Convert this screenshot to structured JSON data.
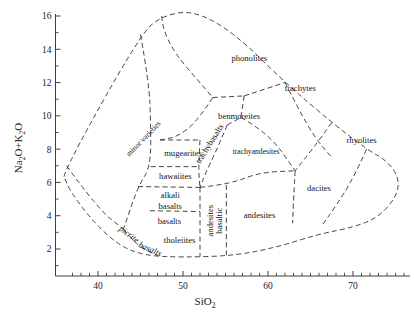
{
  "chart_data": {
    "type": "diagram",
    "title": "",
    "xlabel": "SiO",
    "xlabel_sub": "2",
    "ylabel_parts": [
      "Na",
      "2",
      "O+K",
      "2",
      "O"
    ],
    "ylabel": "Na2O+K2O",
    "xlim": [
      35,
      77
    ],
    "ylim": [
      0,
      16.8
    ],
    "xticks_major": [
      40,
      50,
      60,
      70
    ],
    "xticks_minor": [
      37,
      38,
      39,
      41,
      42,
      43,
      44,
      45,
      46,
      47,
      48,
      49,
      51,
      52,
      53,
      54,
      55,
      56,
      57,
      58,
      59,
      61,
      62,
      63,
      64,
      65,
      66,
      67,
      68,
      69,
      71,
      72,
      73,
      74,
      75,
      76
    ],
    "yticks_major": [
      2,
      4,
      6,
      8,
      10,
      12,
      14,
      16
    ],
    "yticks_minor": [
      1,
      3,
      5,
      7,
      9,
      11,
      13,
      15
    ],
    "grid": false,
    "legend": "none",
    "fields": [
      {
        "name": "phonolites",
        "label": "phonolites",
        "rotation": 0,
        "x": 57.8,
        "y": 13.4
      },
      {
        "name": "trachytes",
        "label": "trachytes",
        "rotation": 0,
        "x": 63.8,
        "y": 11.6
      },
      {
        "name": "rhyolites",
        "label": "rhyolites",
        "rotation": 0,
        "x": 71.0,
        "y": 8.5
      },
      {
        "name": "benmoreites",
        "label": "benmoreites",
        "rotation": 0,
        "x": 56.6,
        "y": 9.9
      },
      {
        "name": "trachyandesites",
        "label": "trachyandesites",
        "rotation": 0,
        "x": 58.6,
        "y": 7.8
      },
      {
        "name": "trachybasalts",
        "label": "trachybasalts",
        "rotation": -58,
        "x": 53.2,
        "y": 8.3
      },
      {
        "name": "mugearites",
        "label": "mugearites",
        "rotation": 0,
        "x": 50.0,
        "y": 7.7
      },
      {
        "name": "hawaiites",
        "label": "hawaiites",
        "rotation": 0,
        "x": 49.1,
        "y": 6.3
      },
      {
        "name": "minor-varieties",
        "label": "minor varieties",
        "rotation": -46,
        "x": 45.4,
        "y": 8.6
      },
      {
        "name": "alkali-basalts-line1",
        "label": "alkali",
        "rotation": 0,
        "x": 48.5,
        "y": 5.2
      },
      {
        "name": "alkali-basalts-line2",
        "label": "basalts",
        "rotation": 0,
        "x": 48.5,
        "y": 4.55
      },
      {
        "name": "basalts",
        "label": "basalts",
        "rotation": 0,
        "x": 48.4,
        "y": 3.6
      },
      {
        "name": "tholeiites",
        "label": "tholeiites",
        "rotation": 0,
        "x": 49.6,
        "y": 2.5
      },
      {
        "name": "picrite-basalts-line1",
        "label": "picrite",
        "rotation": 37,
        "x": 43.6,
        "y": 2.85
      },
      {
        "name": "picrite-basalts-line2",
        "label": "basalts",
        "rotation": 24,
        "x": 46.1,
        "y": 1.95
      },
      {
        "name": "basaltic-andesites-line1",
        "label": "basaltic",
        "rotation": -90,
        "x": 54.3,
        "y": 3.7
      },
      {
        "name": "basaltic-andesites-line2",
        "label": "andesites",
        "rotation": -90,
        "x": 53.3,
        "y": 3.7
      },
      {
        "name": "andesites",
        "label": "andesites",
        "rotation": 0,
        "x": 59.0,
        "y": 4.0
      },
      {
        "name": "dacites",
        "label": "dacites",
        "rotation": 0,
        "x": 66.0,
        "y": 5.6
      }
    ],
    "outline": [
      [
        36.0,
        6.35
      ],
      [
        36.3,
        7.0
      ],
      [
        45.0,
        14.9
      ],
      [
        47.5,
        16.0
      ],
      [
        51.2,
        16.35
      ],
      [
        56.0,
        15.0
      ],
      [
        62.0,
        12.0
      ],
      [
        67.5,
        9.6
      ],
      [
        71.6,
        8.0
      ],
      [
        74.0,
        7.3
      ],
      [
        75.4,
        6.3
      ],
      [
        75.2,
        5.2
      ],
      [
        73.0,
        3.9
      ],
      [
        70.0,
        3.3
      ],
      [
        66.0,
        2.9
      ],
      [
        61.0,
        2.1
      ],
      [
        56.0,
        1.6
      ],
      [
        50.0,
        1.5
      ],
      [
        45.5,
        1.6
      ],
      [
        42.5,
        2.2
      ],
      [
        39.5,
        3.6
      ],
      [
        36.8,
        5.4
      ],
      [
        36.0,
        6.35
      ]
    ],
    "dividers": [
      {
        "name": "phonolites-left",
        "pts": [
          [
            47.5,
            16.0
          ],
          [
            47.6,
            14.6
          ],
          [
            53.5,
            11.1
          ]
        ]
      },
      {
        "name": "phonolites-bottom",
        "pts": [
          [
            53.5,
            11.1
          ],
          [
            57.2,
            11.2
          ]
        ]
      },
      {
        "name": "phonolites-trachytes",
        "pts": [
          [
            57.2,
            11.2
          ],
          [
            62.0,
            12.0
          ]
        ]
      },
      {
        "name": "trachytes-right",
        "pts": [
          [
            62.0,
            12.0
          ],
          [
            63.6,
            10.4
          ],
          [
            65.5,
            8.7
          ],
          [
            67.5,
            7.5
          ]
        ]
      },
      {
        "name": "trachytes-rhyolites",
        "pts": [
          [
            67.5,
            9.6
          ],
          [
            66.4,
            8.8
          ],
          [
            64.6,
            7.6
          ],
          [
            63.2,
            6.7
          ]
        ]
      },
      {
        "name": "rhyolites-dacites",
        "pts": [
          [
            71.6,
            8.0
          ],
          [
            70.0,
            6.2
          ],
          [
            68.0,
            4.6
          ],
          [
            66.4,
            3.45
          ]
        ]
      },
      {
        "name": "benmoreites-left",
        "pts": [
          [
            53.5,
            11.1
          ],
          [
            51.8,
            9.75
          ],
          [
            49.4,
            8.75
          ],
          [
            47.3,
            8.55
          ]
        ]
      },
      {
        "name": "mugearites-top",
        "pts": [
          [
            47.3,
            8.55
          ],
          [
            52.0,
            8.55
          ]
        ]
      },
      {
        "name": "mugearites-bottom",
        "pts": [
          [
            46.2,
            6.95
          ],
          [
            51.8,
            6.95
          ]
        ]
      },
      {
        "name": "trachybasalts-left",
        "pts": [
          [
            52.0,
            8.55
          ],
          [
            51.8,
            6.95
          ],
          [
            52.0,
            5.7
          ]
        ]
      },
      {
        "name": "trachybasalts-right",
        "pts": [
          [
            55.2,
            9.45
          ],
          [
            54.0,
            8.0
          ],
          [
            52.6,
            6.5
          ],
          [
            52.0,
            5.7
          ]
        ]
      },
      {
        "name": "benmoreites-trachyandesites",
        "pts": [
          [
            55.2,
            9.45
          ],
          [
            56.8,
            9.9
          ]
        ]
      },
      {
        "name": "benmoreites-right",
        "pts": [
          [
            57.2,
            11.2
          ],
          [
            56.8,
            9.9
          ]
        ]
      },
      {
        "name": "trachyandesites-right",
        "pts": [
          [
            56.8,
            9.9
          ],
          [
            60.0,
            9.0
          ],
          [
            63.2,
            6.7
          ]
        ]
      },
      {
        "name": "trachyandesites-bottom",
        "pts": [
          [
            52.0,
            5.7
          ],
          [
            55.5,
            5.9
          ],
          [
            59.0,
            6.6
          ],
          [
            63.2,
            6.7
          ]
        ]
      },
      {
        "name": "dacites-andesites",
        "pts": [
          [
            63.2,
            6.7
          ],
          [
            63.0,
            5.0
          ],
          [
            62.9,
            3.55
          ]
        ]
      },
      {
        "name": "hawaiites-bottom",
        "pts": [
          [
            44.7,
            5.75
          ],
          [
            52.0,
            5.7
          ]
        ]
      },
      {
        "name": "minor-varieties-left",
        "pts": [
          [
            36.3,
            7.0
          ],
          [
            40.0,
            4.4
          ],
          [
            43.0,
            3.2
          ]
        ]
      },
      {
        "name": "minor-varieties-right",
        "pts": [
          [
            45.0,
            14.9
          ],
          [
            46.0,
            12.0
          ],
          [
            46.2,
            9.6
          ],
          [
            46.2,
            6.95
          ],
          [
            44.7,
            5.75
          ],
          [
            43.0,
            3.2
          ]
        ]
      },
      {
        "name": "basaltic-andesites-left",
        "pts": [
          [
            52.0,
            5.7
          ],
          [
            52.0,
            1.55
          ]
        ]
      },
      {
        "name": "basaltic-andesites-right",
        "pts": [
          [
            55.1,
            5.85
          ],
          [
            55.1,
            1.62
          ]
        ]
      },
      {
        "name": "alkali-basalts-bottom",
        "pts": [
          [
            46.1,
            4.3
          ],
          [
            52.0,
            4.25
          ]
        ]
      },
      {
        "name": "picrite-cut",
        "pts": [
          [
            43.0,
            3.2
          ],
          [
            44.0,
            2.55
          ],
          [
            45.5,
            1.95
          ],
          [
            47.0,
            1.62
          ]
        ]
      }
    ]
  },
  "axes": {
    "x_axis_name": "sio2-axis",
    "y_axis_name": "na2o-k2o-axis"
  }
}
